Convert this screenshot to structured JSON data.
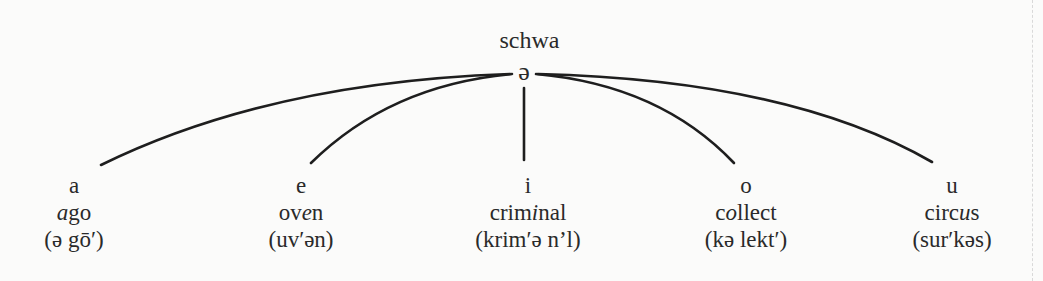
{
  "diagram": {
    "title": "schwa",
    "root_symbol": "ə",
    "line_color": "#1e1e1e",
    "branches": [
      {
        "letter": "a",
        "word_parts": [
          "",
          "a",
          "go"
        ],
        "word": "ago",
        "pronunciation": "(ə gō′)"
      },
      {
        "letter": "e",
        "word_parts": [
          "ov",
          "e",
          "n"
        ],
        "word": "oven",
        "pronunciation": "(uv′ən)"
      },
      {
        "letter": "i",
        "word_parts": [
          "crim",
          "i",
          "nal"
        ],
        "word": "criminal",
        "pronunciation": "(krim′ə n’l)"
      },
      {
        "letter": "o",
        "word_parts": [
          "c",
          "o",
          "llect"
        ],
        "word": "collect",
        "pronunciation": "(kə lekt′)"
      },
      {
        "letter": "u",
        "word_parts": [
          "circ",
          "u",
          "s"
        ],
        "word": "circus",
        "pronunciation": "(sur′kəs)"
      }
    ]
  }
}
